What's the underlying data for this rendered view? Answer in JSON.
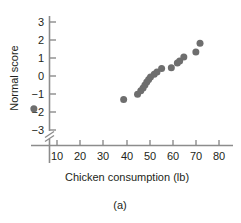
{
  "chart_data": {
    "type": "scatter",
    "title": "",
    "xlabel": "Chicken consumption (lb)",
    "ylabel": "Normal score",
    "caption": "(a)",
    "xlim": [
      0,
      85
    ],
    "ylim": [
      -3.6,
      3.4
    ],
    "xticks": [
      10,
      20,
      30,
      40,
      50,
      60,
      70,
      80
    ],
    "yticks": [
      3,
      2,
      1,
      0,
      -1,
      -2,
      -3
    ],
    "xtick_labels": [
      "10",
      "20",
      "30",
      "40",
      "50",
      "60",
      "70",
      "80"
    ],
    "ytick_labels": [
      "3",
      "2",
      "1",
      "0",
      "−1",
      "−2",
      "−3"
    ],
    "grid": false,
    "legend": false,
    "axis_break": {
      "axis": "y",
      "below": -3,
      "symbol": "double-slash"
    },
    "marker": {
      "shape": "circle",
      "color": "#6e6e6e",
      "size": 4.6
    },
    "axis_color": "#8c8c8c",
    "points": [
      {
        "x": 0.0,
        "y": -1.82
      },
      {
        "x": 38.8,
        "y": -1.3
      },
      {
        "x": 44.8,
        "y": -1.02
      },
      {
        "x": 46.2,
        "y": -0.82
      },
      {
        "x": 47.2,
        "y": -0.66
      },
      {
        "x": 48.0,
        "y": -0.5
      },
      {
        "x": 48.8,
        "y": -0.34
      },
      {
        "x": 49.6,
        "y": -0.2
      },
      {
        "x": 50.4,
        "y": -0.06
      },
      {
        "x": 52.0,
        "y": 0.1
      },
      {
        "x": 53.2,
        "y": 0.22
      },
      {
        "x": 55.2,
        "y": 0.42
      },
      {
        "x": 59.4,
        "y": 0.46
      },
      {
        "x": 62.0,
        "y": 0.72
      },
      {
        "x": 63.0,
        "y": 0.84
      },
      {
        "x": 64.8,
        "y": 1.06
      },
      {
        "x": 70.0,
        "y": 1.34
      },
      {
        "x": 71.8,
        "y": 1.82
      }
    ]
  },
  "figure": {
    "ylabel": "Normal score",
    "xlabel": "Chicken consumption (lb)",
    "caption": "(a)"
  }
}
